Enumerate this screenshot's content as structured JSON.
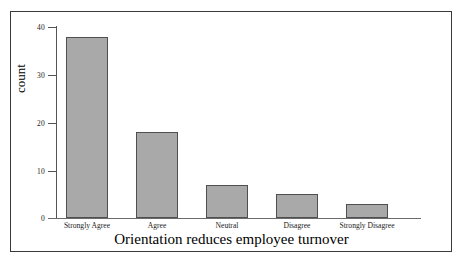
{
  "chart_data": {
    "type": "bar",
    "title": "",
    "xlabel": "Orientation reduces employee turnover",
    "ylabel": "count",
    "categories": [
      "Strongly Agree",
      "Agree",
      "Neutral",
      "Disagree",
      "Strongly Disagree"
    ],
    "values": [
      38,
      18,
      7,
      5,
      3
    ],
    "ylim": [
      0,
      40
    ],
    "yticks": [
      0,
      10,
      20,
      30,
      40
    ],
    "ytick_labels": [
      "0",
      "10",
      "20",
      "30",
      "40"
    ],
    "grid": false,
    "legend": null,
    "bar_color": "#a9a9a9",
    "bar_edge_color": "#4f4f4f",
    "axis_color": "#555555",
    "frame_color": "#3a3a3a",
    "background": "#ffffff"
  }
}
